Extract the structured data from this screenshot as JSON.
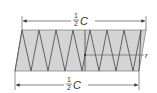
{
  "diagram": {
    "type": "helical-spring-unrolled",
    "colors": {
      "fill": "#d4d4d4",
      "stroke": "#555555",
      "line": "#444444",
      "background": "#ffffff"
    },
    "top_dimension": {
      "numerator": "1",
      "denominator": "2",
      "symbol": "C"
    },
    "bottom_dimension": {
      "numerator": "1",
      "denominator": "2",
      "symbol": "C"
    },
    "radius_label": "r",
    "zigzag": {
      "top_vertices_x": [
        22,
        39,
        56,
        73,
        90,
        107,
        124,
        141
      ],
      "bottom_vertices_x": [
        15,
        31,
        48,
        65,
        82,
        99,
        116,
        133
      ],
      "top_y": 30,
      "bottom_y": 71
    }
  }
}
